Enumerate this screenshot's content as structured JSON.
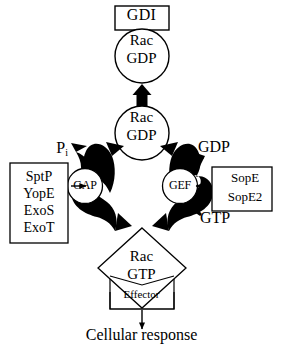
{
  "diagram": {
    "colors": {
      "stroke": "#000000",
      "fill_arrow": "#000000",
      "background": "#ffffff"
    },
    "nodes": {
      "gdi": {
        "label": "GDI",
        "shape": "rectangle"
      },
      "rac_gdp_top": {
        "line1": "Rac",
        "line2": "GDP",
        "shape": "circle"
      },
      "rac_gdp_mid": {
        "line1": "Rac",
        "line2": "GDP",
        "shape": "circle"
      },
      "gap": {
        "label": "GAP",
        "shape": "circle"
      },
      "gef": {
        "label": "GEF",
        "shape": "circle"
      },
      "rac_gtp": {
        "line1": "Rac",
        "line2": "GTP",
        "shape": "diamond"
      },
      "effector": {
        "label": "Effector",
        "shape": "notched-rectangle"
      }
    },
    "bacterial_effector_boxes": {
      "gap_activators": {
        "items": [
          "SptP",
          "YopE",
          "ExoS",
          "ExoT"
        ],
        "text": "SptP\nYopE\nExoS\nExoT"
      },
      "gef_mimics": {
        "items": [
          "SopE",
          "SopE2"
        ],
        "text": "SopE\nSopE2"
      }
    },
    "annotations": {
      "pi": {
        "text": "P",
        "subscript": "i"
      },
      "gdp_released": "GDP",
      "gtp_loaded": "GTP",
      "outcome": "Cellular response"
    },
    "icon_names": [
      "double-headed-arrow-icon",
      "curved-hydrolysis-arrow-icon",
      "curved-exchange-arrow-icon",
      "pi-release-arrow-icon",
      "gdp-release-arrow-icon",
      "gtp-loading-arrow-icon",
      "arrow-right-icon",
      "arrow-left-icon",
      "arrow-down-icon"
    ]
  }
}
